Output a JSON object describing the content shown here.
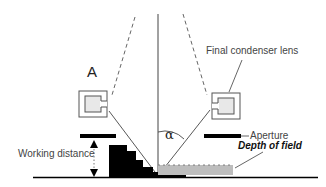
{
  "diagram": {
    "labels": {
      "lens_set": "A",
      "final_condenser_lens": "Final condenser lens",
      "aperture": "Aperture",
      "depth_of_field": "Depth of field",
      "working_distance": "Working distance",
      "angle": "α"
    },
    "colors": {
      "line": "#333333",
      "dashed_line": "#666666",
      "lens_fill": "#e8e8e8",
      "aperture_fill": "#000000",
      "specimen_fill": "#000000",
      "depth_of_field_fill": "#bdbdbd"
    }
  }
}
